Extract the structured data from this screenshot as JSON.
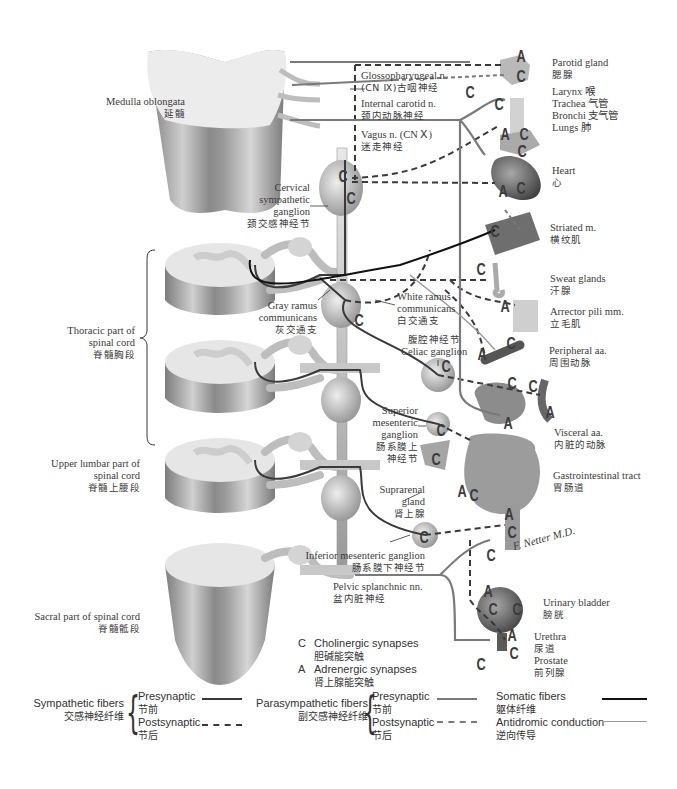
{
  "left_labels": {
    "medulla": {
      "en": "Medulla oblongata",
      "zh": "延髓"
    },
    "thoracic": {
      "en1": "Thoracic part of",
      "en2": "spinal cord",
      "zh": "脊髓胸段"
    },
    "upper_lumbar": {
      "en1": "Upper lumbar part of",
      "en2": "spinal cord",
      "zh": "脊髓上腰段"
    },
    "sacral": {
      "en": "Sacral part of spinal cord",
      "zh": "脊髓骶段"
    }
  },
  "center_labels": {
    "glossopharyngeal": {
      "en1": "Glossopharyngeal n.",
      "en2": "(CN Ⅸ)古咽神经"
    },
    "internal_carotid": {
      "en": "Internal carotid n.",
      "zh": "颈内动脉神经"
    },
    "vagus": {
      "en": "Vagus n. (CN Ⅹ)",
      "zh": "迷走神经"
    },
    "cervical_ganglion": {
      "en1": "Cervical",
      "en2": "sympathetic",
      "en3": "ganglion",
      "zh": "颈交感神经节"
    },
    "gray_ramus": {
      "en1": "Gray ramus",
      "en2": "communicans",
      "zh": "灰交通支"
    },
    "white_ramus": {
      "en1": "White ramus",
      "en2": "communicans",
      "zh": "白交通支"
    },
    "celiac": {
      "zh": "腹腔神经节",
      "en": "Celiac ganglion"
    },
    "superior_mesenteric": {
      "en1": "Superior",
      "en2": "mesenteric",
      "en3": "ganglion",
      "zh1": "肠系膜上",
      "zh2": "神经节"
    },
    "suprarenal": {
      "en1": "Suprarenal",
      "en2": "gland",
      "zh": "肾上腺"
    },
    "inferior_mesenteric": {
      "en": "Inferior mesenteric ganglion",
      "zh": "肠系膜下神经节"
    },
    "pelvic_splanchnic": {
      "en": "Pelvic splanchnic nn.",
      "zh": "盆内脏神经"
    }
  },
  "right_labels": {
    "parotid": {
      "en": "Parotid gland",
      "zh": "腮腺"
    },
    "airway": {
      "l1": "Larynx 喉",
      "l2": "Trachea 气管",
      "l3": "Bronchi 支气管",
      "l4": "Lungs 肺"
    },
    "heart": {
      "en": "Heart",
      "zh": "心"
    },
    "striated": {
      "en": "Striated m.",
      "zh": "横纹肌"
    },
    "sweat": {
      "en": "Sweat glands",
      "zh": "汗腺"
    },
    "arrector": {
      "en": "Arrector pili mm.",
      "zh": "立毛肌"
    },
    "peripheral": {
      "en": "Peripheral aa.",
      "zh": "周围动脉"
    },
    "visceral": {
      "en": "Visceral aa.",
      "zh": "内脏的动脉"
    },
    "gi": {
      "en": "Gastrointestinal tract",
      "zh": "胃肠道"
    },
    "bladder": {
      "en": "Urinary bladder",
      "zh": "膀胱"
    },
    "urethra": {
      "en": "Urethra",
      "zh": "尿道"
    },
    "prostate": {
      "en": "Prostate",
      "zh": "前列腺"
    }
  },
  "synapse_key": {
    "c": {
      "letter": "C",
      "en": "Cholinergic synapses",
      "zh": "胆碱能突触"
    },
    "a": {
      "letter": "A",
      "en": "Adrenergic synapses",
      "zh": "肾上腺能突触"
    }
  },
  "legend": {
    "sympathetic": {
      "en": "Sympathetic fibers",
      "zh": "交感神经纤维",
      "pre": "Presynaptic",
      "pre_zh": "节前",
      "post": "Postsynaptic",
      "post_zh": "节后"
    },
    "parasympathetic": {
      "en": "Parasympathetic fibers",
      "zh": "副交感神经纤维",
      "pre": "Presynaptic",
      "pre_zh": "节前",
      "post": "Postsynaptic",
      "post_zh": "节后"
    },
    "somatic": {
      "en": "Somatic fibers",
      "zh": "躯体纤维"
    },
    "antidromic": {
      "en": "Antidromic conduction",
      "zh": "逆向传导"
    }
  },
  "signature": "F. Netter M.D.",
  "colors": {
    "sympathetic": "#3a3a3a",
    "parasympathetic": "#7a7a7a",
    "somatic": "#111111",
    "antidromic": "#9a9a9a",
    "tissue": "#c9c9c9"
  },
  "synapse_markers": [
    {
      "letter": "A",
      "x": 521,
      "y": 58
    },
    {
      "letter": "C",
      "x": 521,
      "y": 78
    },
    {
      "letter": "C",
      "x": 470,
      "y": 94
    },
    {
      "letter": "C",
      "x": 499,
      "y": 106
    },
    {
      "letter": "A",
      "x": 505,
      "y": 136
    },
    {
      "letter": "C",
      "x": 524,
      "y": 136
    },
    {
      "letter": "C",
      "x": 522,
      "y": 153
    },
    {
      "letter": "A",
      "x": 503,
      "y": 193
    },
    {
      "letter": "C",
      "x": 521,
      "y": 190
    },
    {
      "letter": "C",
      "x": 343,
      "y": 178
    },
    {
      "letter": "C",
      "x": 351,
      "y": 200
    },
    {
      "letter": "C",
      "x": 359,
      "y": 322
    },
    {
      "letter": "C",
      "x": 495,
      "y": 233
    },
    {
      "letter": "C",
      "x": 481,
      "y": 271
    },
    {
      "letter": "A",
      "x": 505,
      "y": 308
    },
    {
      "letter": "C",
      "x": 511,
      "y": 345
    },
    {
      "letter": "A",
      "x": 482,
      "y": 356
    },
    {
      "letter": "C",
      "x": 512,
      "y": 385
    },
    {
      "letter": "C",
      "x": 533,
      "y": 388
    },
    {
      "letter": "A",
      "x": 550,
      "y": 414
    },
    {
      "letter": "C",
      "x": 446,
      "y": 368
    },
    {
      "letter": "C",
      "x": 441,
      "y": 432
    },
    {
      "letter": "C",
      "x": 436,
      "y": 461
    },
    {
      "letter": "A",
      "x": 508,
      "y": 425
    },
    {
      "letter": "A",
      "x": 462,
      "y": 493
    },
    {
      "letter": "C",
      "x": 474,
      "y": 497
    },
    {
      "letter": "A",
      "x": 509,
      "y": 516
    },
    {
      "letter": "C",
      "x": 512,
      "y": 534
    },
    {
      "letter": "C",
      "x": 491,
      "y": 557
    },
    {
      "letter": "C",
      "x": 424,
      "y": 539
    },
    {
      "letter": "A",
      "x": 488,
      "y": 593
    },
    {
      "letter": "C",
      "x": 493,
      "y": 611
    },
    {
      "letter": "C",
      "x": 517,
      "y": 611
    },
    {
      "letter": "A",
      "x": 512,
      "y": 637
    },
    {
      "letter": "C",
      "x": 514,
      "y": 655
    },
    {
      "letter": "C",
      "x": 481,
      "y": 666
    }
  ]
}
